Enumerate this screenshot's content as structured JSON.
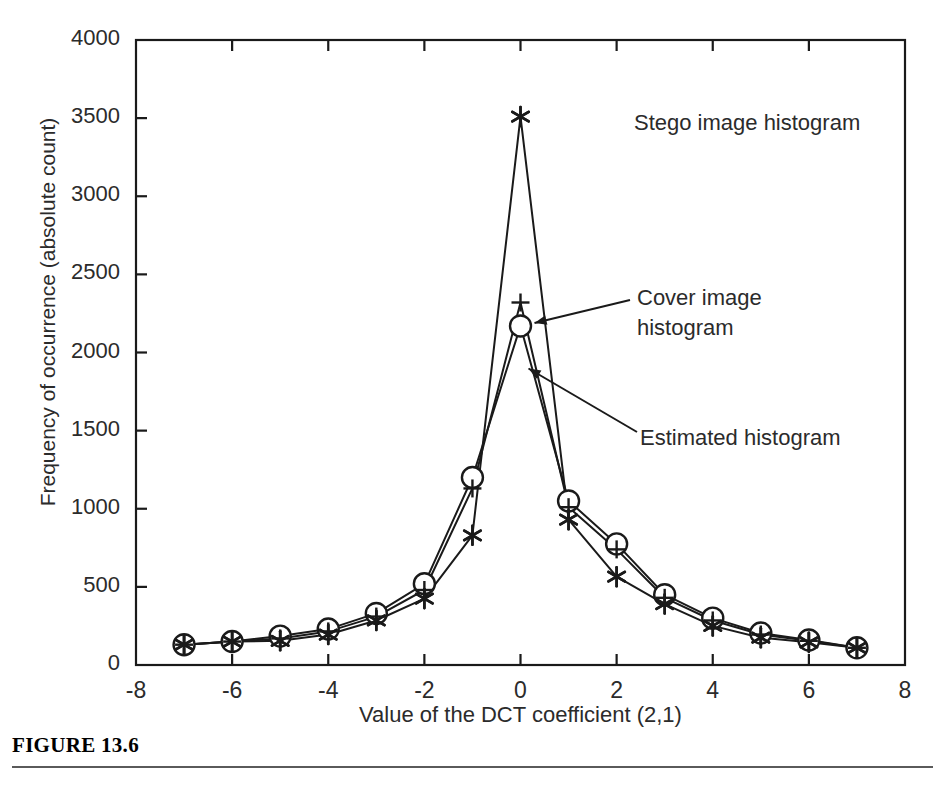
{
  "figure": {
    "caption": "FIGURE 13.6",
    "caption_rule": true
  },
  "axes": {
    "x_title": "Value of the DCT coefficient (2,1)",
    "y_title": "Frequency of occurrence (absolute count)",
    "x_ticks": [
      "-8",
      "-6",
      "-4",
      "-2",
      "0",
      "2",
      "4",
      "6",
      "8"
    ],
    "y_ticks": [
      "0",
      "500",
      "1000",
      "1500",
      "2000",
      "2500",
      "3000",
      "3500",
      "4000"
    ]
  },
  "annotations": {
    "stego": "Stego image histogram",
    "cover": "Cover image\nhistogram",
    "estimated": "Estimated histogram"
  },
  "colors": {
    "ink": "#1a1a1a",
    "text": "#2b2b2b",
    "rule": "#5a5a5a",
    "background": "#ffffff"
  },
  "chart_data": {
    "type": "line",
    "title": "",
    "xlabel": "Value of the DCT coefficient (2,1)",
    "ylabel": "Frequency of occurrence (absolute count)",
    "xlim": [
      -8,
      8
    ],
    "ylim": [
      0,
      4000
    ],
    "xticks": [
      -8,
      -6,
      -4,
      -2,
      0,
      2,
      4,
      6,
      8
    ],
    "yticks": [
      0,
      500,
      1000,
      1500,
      2000,
      2500,
      3000,
      3500,
      4000
    ],
    "grid": false,
    "legend_position": "inline-annotations",
    "x": [
      -7,
      -6,
      -5,
      -4,
      -3,
      -2,
      -1,
      0,
      1,
      2,
      3,
      4,
      5,
      6,
      7
    ],
    "series": [
      {
        "name": "Cover image histogram",
        "marker": "circle",
        "values": [
          130,
          150,
          185,
          230,
          330,
          520,
          1200,
          2170,
          1050,
          775,
          450,
          300,
          205,
          160,
          110
        ]
      },
      {
        "name": "Stego image histogram",
        "marker": "asterisk",
        "values": [
          130,
          150,
          155,
          195,
          285,
          425,
          830,
          3510,
          930,
          565,
          390,
          250,
          175,
          145,
          110
        ]
      },
      {
        "name": "Estimated histogram",
        "marker": "plus",
        "values": [
          130,
          150,
          170,
          215,
          310,
          480,
          1130,
          2320,
          1010,
          740,
          430,
          285,
          195,
          155,
          110
        ]
      }
    ]
  }
}
